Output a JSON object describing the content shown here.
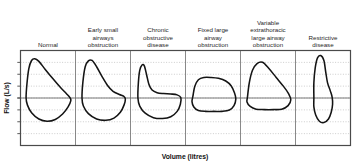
{
  "figure": {
    "title": "",
    "axes": {
      "x_label": "Volume (litres)",
      "y_label": "Flow (L/s)"
    },
    "panels": [
      {
        "id": "normal",
        "label_lines": [
          "Normal"
        ]
      },
      {
        "id": "early-small-airways-obstruction",
        "label_lines": [
          "Early small",
          "airways",
          "obstruction"
        ]
      },
      {
        "id": "chronic-obstructive-disease",
        "label_lines": [
          "Chronic",
          "obstructive",
          "disease"
        ]
      },
      {
        "id": "fixed-large-airway-obstruction",
        "label_lines": [
          "Fixed large",
          "airway",
          "obstruction"
        ]
      },
      {
        "id": "variable-extrathoracic-large-airway-obstruction",
        "label_lines": [
          "Variable",
          "extrathoracic",
          "large airway",
          "obstruction"
        ]
      },
      {
        "id": "restrictive-disease",
        "label_lines": [
          "Restrictive",
          "disease"
        ]
      }
    ],
    "colors": {
      "curve": "#141414",
      "frame": "#4a4a4a",
      "gridline": "#9a9a9a",
      "zero_line": "#6b6b6b",
      "divider": "#6b6b6b",
      "background": "#ffffff"
    }
  },
  "chart_data": {
    "type": "line",
    "title": "",
    "xlabel": "Volume (litres)",
    "ylabel": "Flow (L/s)",
    "subtitle": "Spirometry flow-volume loops in health and disease",
    "grid": true,
    "legend_position": "none",
    "axis_note": "Axes are unscaled (no numeric tick labels); horizontal zero-flow line separates expiration (above) from inspiration (below).",
    "panel_count": 6,
    "gridline_count_horizontal": 7,
    "series": [
      {
        "name": "Normal",
        "description": "Rapid rise to a high early peak expiratory flow followed by a straight, linear descent to residual volume; smooth semicircular inspiratory limb.",
        "peak_expiratory_flow": 0.88,
        "peak_inspiratory_flow": -0.52,
        "expiratory_shape": "sharp peak, linear downslope",
        "inspiratory_shape": "smooth rounded",
        "loop_points": [
          [
            0.02,
            0.0
          ],
          [
            0.04,
            0.33
          ],
          [
            0.08,
            0.66
          ],
          [
            0.14,
            0.84
          ],
          [
            0.21,
            0.88
          ],
          [
            0.3,
            0.82
          ],
          [
            0.44,
            0.64
          ],
          [
            0.6,
            0.44
          ],
          [
            0.76,
            0.25
          ],
          [
            0.9,
            0.1
          ],
          [
            0.98,
            0.01
          ],
          [
            1.0,
            -0.06
          ],
          [
            0.94,
            -0.2
          ],
          [
            0.82,
            -0.36
          ],
          [
            0.66,
            -0.48
          ],
          [
            0.48,
            -0.52
          ],
          [
            0.3,
            -0.47
          ],
          [
            0.14,
            -0.33
          ],
          [
            0.05,
            -0.16
          ],
          [
            0.02,
            0.0
          ]
        ]
      },
      {
        "name": "Early small airways obstruction",
        "description": "Near-normal peak flow but the descending expiratory limb becomes concave (scooped) as flow falls disproportionately at low lung volumes.",
        "peak_expiratory_flow": 0.84,
        "peak_inspiratory_flow": -0.5,
        "expiratory_shape": "peak with mildly concave (scooped) downslope",
        "inspiratory_shape": "smooth rounded",
        "loop_points": [
          [
            0.04,
            0.0
          ],
          [
            0.06,
            0.36
          ],
          [
            0.11,
            0.7
          ],
          [
            0.18,
            0.83
          ],
          [
            0.26,
            0.84
          ],
          [
            0.36,
            0.7
          ],
          [
            0.48,
            0.48
          ],
          [
            0.6,
            0.28
          ],
          [
            0.72,
            0.15
          ],
          [
            0.86,
            0.08
          ],
          [
            0.95,
            0.04
          ],
          [
            0.99,
            -0.02
          ],
          [
            0.96,
            -0.16
          ],
          [
            0.88,
            -0.32
          ],
          [
            0.74,
            -0.45
          ],
          [
            0.56,
            -0.5
          ],
          [
            0.36,
            -0.47
          ],
          [
            0.18,
            -0.35
          ],
          [
            0.07,
            -0.18
          ],
          [
            0.04,
            0.0
          ]
        ]
      },
      {
        "name": "Chronic obstructive disease",
        "description": "Brief narrow spike of peak flow then a steep fall to a markedly scooped, almost flat low-flow expiratory limb; loop shifted toward higher lung volumes.",
        "peak_expiratory_flow": 0.74,
        "peak_inspiratory_flow": -0.46,
        "expiratory_shape": "narrow spike then deeply concave near-zero flow",
        "inspiratory_shape": "rounded, reduced",
        "loop_points": [
          [
            0.06,
            0.0
          ],
          [
            0.07,
            0.34
          ],
          [
            0.1,
            0.62
          ],
          [
            0.15,
            0.74
          ],
          [
            0.2,
            0.72
          ],
          [
            0.25,
            0.52
          ],
          [
            0.3,
            0.31
          ],
          [
            0.37,
            0.18
          ],
          [
            0.48,
            0.12
          ],
          [
            0.62,
            0.1
          ],
          [
            0.78,
            0.09
          ],
          [
            0.92,
            0.07
          ],
          [
            1.0,
            0.01
          ],
          [
            0.99,
            -0.14
          ],
          [
            0.92,
            -0.3
          ],
          [
            0.78,
            -0.42
          ],
          [
            0.6,
            -0.46
          ],
          [
            0.4,
            -0.44
          ],
          [
            0.22,
            -0.34
          ],
          [
            0.1,
            -0.18
          ],
          [
            0.06,
            0.0
          ]
        ]
      },
      {
        "name": "Fixed large airway obstruction",
        "description": "Both expiratory and inspiratory limbs are flattened and plateau, producing a squared-off box-like loop with reduced peak flows in both directions.",
        "peak_expiratory_flow": 0.46,
        "peak_inspiratory_flow": -0.3,
        "expiratory_shape": "flattened plateau",
        "inspiratory_shape": "flattened plateau",
        "loop_points": [
          [
            0.06,
            0.04
          ],
          [
            0.1,
            0.26
          ],
          [
            0.18,
            0.41
          ],
          [
            0.3,
            0.46
          ],
          [
            0.46,
            0.46
          ],
          [
            0.62,
            0.44
          ],
          [
            0.78,
            0.38
          ],
          [
            0.9,
            0.27
          ],
          [
            0.97,
            0.12
          ],
          [
            1.0,
            -0.02
          ],
          [
            0.96,
            -0.17
          ],
          [
            0.86,
            -0.27
          ],
          [
            0.7,
            -0.3
          ],
          [
            0.52,
            -0.3
          ],
          [
            0.34,
            -0.3
          ],
          [
            0.18,
            -0.28
          ],
          [
            0.08,
            -0.2
          ],
          [
            0.04,
            -0.08
          ],
          [
            0.06,
            0.04
          ]
        ]
      },
      {
        "name": "Variable extrathoracic large airway obstruction",
        "description": "Preserved, near-triangular expiratory limb with a selectively flattened (plateaued) inspiratory limb.",
        "peak_expiratory_flow": 0.8,
        "peak_inspiratory_flow": -0.26,
        "expiratory_shape": "near-normal triangular peak and descent",
        "inspiratory_shape": "flattened plateau",
        "loop_points": [
          [
            0.05,
            0.02
          ],
          [
            0.09,
            0.34
          ],
          [
            0.16,
            0.62
          ],
          [
            0.26,
            0.77
          ],
          [
            0.38,
            0.8
          ],
          [
            0.52,
            0.66
          ],
          [
            0.68,
            0.46
          ],
          [
            0.84,
            0.26
          ],
          [
            0.95,
            0.1
          ],
          [
            1.0,
            -0.04
          ],
          [
            0.94,
            -0.17
          ],
          [
            0.8,
            -0.25
          ],
          [
            0.62,
            -0.26
          ],
          [
            0.42,
            -0.26
          ],
          [
            0.24,
            -0.25
          ],
          [
            0.11,
            -0.19
          ],
          [
            0.04,
            -0.09
          ],
          [
            0.05,
            0.02
          ]
        ]
      },
      {
        "name": "Restrictive disease",
        "description": "Tall narrow loop with preserved or high peak flow but greatly reduced vital capacity; the whole loop is compressed along the volume axis.",
        "peak_expiratory_flow": 0.95,
        "peak_inspiratory_flow": -0.55,
        "expiratory_shape": "tall peak, narrow width",
        "inspiratory_shape": "narrow rounded",
        "loop_points": [
          [
            0.3,
            0.0
          ],
          [
            0.3,
            0.34
          ],
          [
            0.33,
            0.68
          ],
          [
            0.38,
            0.9
          ],
          [
            0.45,
            0.95
          ],
          [
            0.52,
            0.84
          ],
          [
            0.56,
            0.58
          ],
          [
            0.6,
            0.34
          ],
          [
            0.66,
            0.16
          ],
          [
            0.7,
            0.02
          ],
          [
            0.71,
            -0.14
          ],
          [
            0.68,
            -0.32
          ],
          [
            0.62,
            -0.47
          ],
          [
            0.52,
            -0.55
          ],
          [
            0.42,
            -0.52
          ],
          [
            0.34,
            -0.38
          ],
          [
            0.3,
            -0.2
          ],
          [
            0.3,
            0.0
          ]
        ]
      }
    ]
  }
}
